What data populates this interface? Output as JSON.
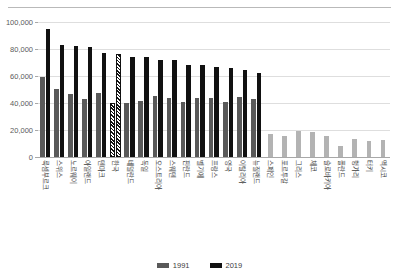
{
  "figure": {
    "corner_mark": "",
    "background": "#ffffff"
  },
  "colors": {
    "series_1991": "#595959",
    "series_2019": "#111111",
    "muted": "#b3b3b3",
    "gridline": "#dedede",
    "axis": "#a8a8a8",
    "text": "#3c3c3c"
  },
  "legend": {
    "position": "bottom-center",
    "items": [
      {
        "label": "1991",
        "color": "#595959"
      },
      {
        "label": "2019",
        "color": "#111111"
      }
    ]
  },
  "yaxis": {
    "ticks": [
      "0",
      "20,000",
      "40,000",
      "60,000",
      "80,000",
      "100,000"
    ],
    "tick_values": [
      0,
      20000,
      40000,
      60000,
      80000,
      100000
    ],
    "min": 0,
    "max": 100000
  },
  "chart_data": {
    "type": "bar",
    "title": "",
    "subtitle": "",
    "xlabel": "",
    "ylabel": "",
    "ylim": [
      0,
      100000
    ],
    "grid": true,
    "legend_position": "bottom-center",
    "highlight_category": "한국",
    "categories": [
      "룩셈부르크",
      "스위스",
      "노르웨이",
      "아일랜드",
      "덴마크",
      "한국",
      "네덜란드",
      "독일",
      "오스트리아",
      "스웨덴",
      "핀란드",
      "벨기에",
      "프랑스",
      "영국",
      "이탈리아",
      "뉴질랜드",
      "스페인",
      "포르투갈",
      "그리스",
      "체코",
      "슬로바키아",
      "폴란드",
      "헝가리",
      "터키",
      "멕시코"
    ],
    "series": [
      {
        "name": "1991",
        "color": "#595959",
        "values": [
          59500,
          50500,
          46800,
          43200,
          47500,
          39800,
          39700,
          41500,
          45000,
          43500,
          40400,
          43800,
          44000,
          41000,
          44500,
          42800,
          16800,
          15200,
          19000,
          18500,
          15500,
          8500,
          13000,
          11500,
          12500
        ]
      },
      {
        "name": "2019",
        "color": "#111111",
        "values": [
          94500,
          83000,
          82000,
          81800,
          77000,
          76000,
          74000,
          73800,
          72000,
          71500,
          68500,
          68000,
          66800,
          66000,
          64500,
          62000,
          61000,
          60500,
          60000,
          59800,
          58000,
          57500,
          57000,
          56500,
          56000
        ]
      }
    ]
  }
}
